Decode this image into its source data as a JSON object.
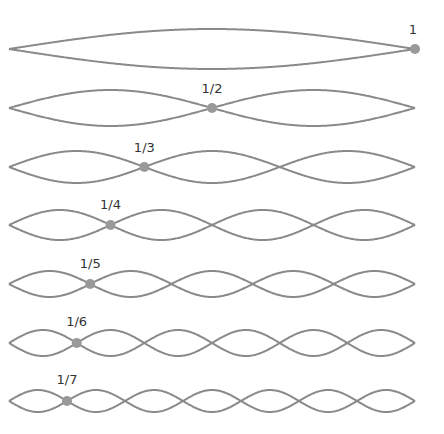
{
  "diagram": {
    "type": "standing-wave-harmonics",
    "string": {
      "x_start": 9,
      "x_end": 415,
      "color": "#8a8a8a",
      "stroke_width": 2
    },
    "node_dot": {
      "color": "#999999",
      "radius": 5
    },
    "rows": [
      {
        "harmonic": 1,
        "label": "1",
        "cy": 49,
        "amp": 20,
        "label_y": 22
      },
      {
        "harmonic": 2,
        "label": "1/2",
        "cy": 108,
        "amp": 18,
        "label_y": 81
      },
      {
        "harmonic": 3,
        "label": "1/3",
        "cy": 167,
        "amp": 16,
        "label_y": 140
      },
      {
        "harmonic": 4,
        "label": "1/4",
        "cy": 225,
        "amp": 15,
        "label_y": 197
      },
      {
        "harmonic": 5,
        "label": "1/5",
        "cy": 284,
        "amp": 13,
        "label_y": 256
      },
      {
        "harmonic": 6,
        "label": "1/6",
        "cy": 343,
        "amp": 13,
        "label_y": 314
      },
      {
        "harmonic": 7,
        "label": "1/7",
        "cy": 401,
        "amp": 11,
        "label_y": 372
      }
    ]
  }
}
